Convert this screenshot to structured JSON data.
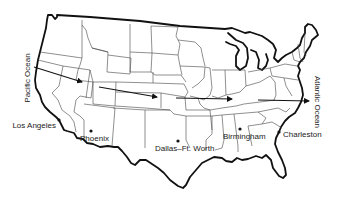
{
  "map": {
    "title": "",
    "oceans": [
      {
        "name": "Pacific Ocean",
        "x": 30,
        "y": 78,
        "rotate": -90
      },
      {
        "name": "Atlantic Ocean",
        "x": 315,
        "y": 102,
        "rotate": 90
      }
    ],
    "cities": [
      {
        "name": "Los Angeles",
        "dot_x": 59,
        "dot_y": 120,
        "label_x": 56,
        "label_y": 128,
        "anchor": "end"
      },
      {
        "name": "Phoenix",
        "dot_x": 91,
        "dot_y": 131,
        "label_x": 80,
        "label_y": 141,
        "anchor": "start"
      },
      {
        "name": "Dallas–Ft. Worth",
        "dot_x": 178,
        "dot_y": 141,
        "label_x": 155,
        "label_y": 151,
        "anchor": "start"
      },
      {
        "name": "Birmingham",
        "dot_x": 240,
        "dot_y": 129,
        "label_x": 223,
        "label_y": 139,
        "anchor": "start"
      },
      {
        "name": "Charleston",
        "dot_x": 279,
        "dot_y": 132,
        "label_x": 283,
        "label_y": 137,
        "anchor": "start"
      }
    ],
    "arrows": [
      {
        "from": [
          34,
          67
        ],
        "to": [
          82,
          82
        ]
      },
      {
        "from": [
          99,
          87
        ],
        "to": [
          157,
          97
        ]
      },
      {
        "from": [
          176,
          98
        ],
        "to": [
          232,
          99
        ]
      },
      {
        "from": [
          258,
          100
        ],
        "to": [
          309,
          101
        ]
      }
    ],
    "colors": {
      "line": "#111111",
      "border": "#444444",
      "background": "#ffffff"
    }
  }
}
